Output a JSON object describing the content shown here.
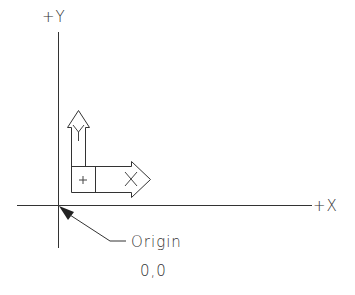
{
  "diagram": {
    "axes": {
      "y_label": "+Y",
      "x_label": "+X"
    },
    "ucs_icon": {
      "y_arrow_letter": "Y",
      "x_arrow_letter": "X",
      "center_mark": "+"
    },
    "callout": {
      "label": "Origin",
      "coordinates": "0,0"
    },
    "colors": {
      "line": "#333333",
      "background": "#ffffff"
    }
  }
}
